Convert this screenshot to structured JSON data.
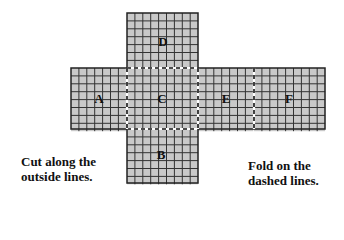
{
  "diagram": {
    "type": "cube-net",
    "cell_size": 7.9,
    "fill_color": "#c9c9c9",
    "grid_color": "#333333",
    "panels": [
      {
        "label": "D",
        "x": 127,
        "y": 13,
        "cols": 9,
        "rows": 7,
        "label_x": 163,
        "label_y": 46
      },
      {
        "label": "A",
        "x": 71,
        "y": 68,
        "cols": 7,
        "rows": 8,
        "label_x": 99,
        "label_y": 103
      },
      {
        "label": "C",
        "x": 127,
        "y": 68,
        "cols": 9,
        "rows": 8,
        "label_x": 162,
        "label_y": 103
      },
      {
        "label": "E",
        "x": 198,
        "y": 68,
        "cols": 7,
        "rows": 8,
        "label_x": 226,
        "label_y": 103
      },
      {
        "label": "F",
        "x": 254,
        "y": 68,
        "cols": 9,
        "rows": 8,
        "label_x": 289,
        "label_y": 103
      },
      {
        "label": "B",
        "x": 127,
        "y": 129,
        "cols": 9,
        "rows": 7,
        "label_x": 161,
        "label_y": 159
      }
    ]
  },
  "captions": {
    "left_line1": "Cut along the",
    "left_line2": "outside lines.",
    "right_line1": "Fold on the",
    "right_line2": "dashed lines."
  }
}
